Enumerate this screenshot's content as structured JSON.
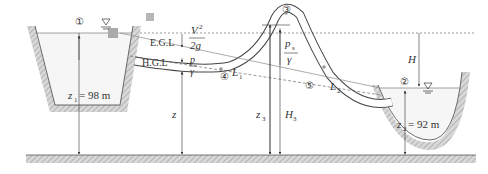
{
  "diagram": {
    "points": {
      "p1": "①",
      "p2": "②",
      "p3": "③",
      "p4": "④",
      "p5": "⑤"
    },
    "lines": {
      "egl": "E.G.L",
      "hgl": "H.G.L"
    },
    "labels": {
      "velocity_head_num": "V",
      "velocity_head_sup": "2",
      "velocity_head_den": "2g",
      "pressure_head_num": "p",
      "pressure_head_den": "γ",
      "siphon_pressure_num": "p",
      "siphon_pressure_sub": "s",
      "siphon_pressure_den": "γ",
      "L1": "L",
      "L1_sub": "1",
      "L2": "L",
      "L2_sub": "2",
      "H": "H",
      "z": "z",
      "z3": "z",
      "z3_sub": "3",
      "H3": "H",
      "H3_sub": "3",
      "z1": "z",
      "z1_sub": "1",
      "z1_value": " = 98 m",
      "z2": "z",
      "z2_sub": "2",
      "z2_value": "= 92 m"
    },
    "colors": {
      "ink": "#333333",
      "hatch": "#b0b0b0",
      "water": "#f4f4f4"
    }
  }
}
